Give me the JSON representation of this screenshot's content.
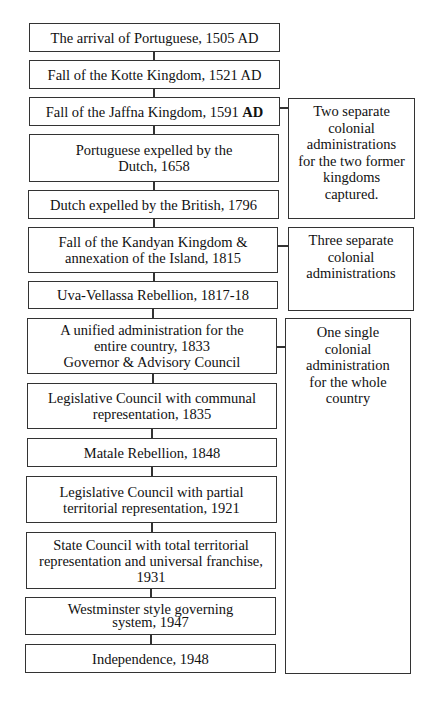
{
  "timeline": [
    {
      "text": "The arrival of Portuguese, 1505 AD"
    },
    {
      "text": "Fall of the Kotte Kingdom, 1521 AD"
    },
    {
      "text": "Fall of the Jaffna Kingdom, 1591 ",
      "bold_suffix": "AD"
    },
    {
      "text": "Portuguese expelled by the Dutch, 1658"
    },
    {
      "text": "Dutch expelled by the British, 1796"
    },
    {
      "text": "Fall of the Kandyan Kingdom & annexation of the Island, 1815"
    },
    {
      "text": "Uva-Vellassa Rebellion, 1817-18"
    },
    {
      "line1": "A unified administration for the entire country, 1833",
      "line2": "Governor & Advisory Council"
    },
    {
      "text": "Legislative Council with communal representation, 1835"
    },
    {
      "text": "Matale Rebellion, 1848"
    },
    {
      "text": "Legislative Council with partial territorial representation, 1921"
    },
    {
      "text": "State Council with total territorial representation and universal franchise, 1931"
    },
    {
      "text": "Westminster style governing system, 1947"
    },
    {
      "text": "Independence, 1948"
    }
  ],
  "phases": [
    {
      "text": "Two separate colonial administrations for the two former kingdoms captured."
    },
    {
      "text": "Three separate colonial administrations"
    },
    {
      "text": "One single colonial administration for the whole country"
    }
  ]
}
